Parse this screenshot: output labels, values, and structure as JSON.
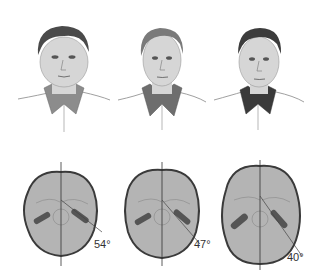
{
  "figure": {
    "faces": [
      {
        "id": "face-1",
        "description": "broad face",
        "hair_color": "#4a4a4a",
        "collar_color": "#8c8c8c"
      },
      {
        "id": "face-2",
        "description": "medium face",
        "hair_color": "#7a7a7a",
        "collar_color": "#6e6e6e"
      },
      {
        "id": "face-3",
        "description": "narrow face",
        "hair_color": "#3c3c3c",
        "collar_color": "#3a3a3a"
      }
    ],
    "skulls": [
      {
        "id": "skull-1",
        "angle_label": "54°",
        "angle": 54
      },
      {
        "id": "skull-2",
        "angle_label": "47°",
        "angle": 47
      },
      {
        "id": "skull-3",
        "angle_label": "40°",
        "angle": 40
      }
    ],
    "colors": {
      "skin": "#d6d6d6",
      "skull_fill": "#b4b4b4",
      "skull_outline": "#3a3a3a",
      "line": "#555555"
    }
  }
}
